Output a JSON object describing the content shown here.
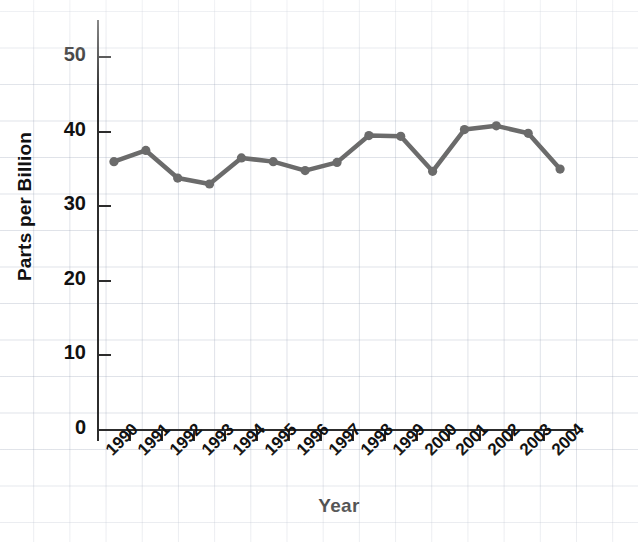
{
  "chart_data": {
    "type": "line",
    "title": "",
    "xlabel": "Year",
    "ylabel": "Parts per Billion",
    "categories": [
      "1990",
      "1991",
      "1992",
      "1993",
      "1994",
      "1995",
      "1996",
      "1997",
      "1998",
      "1999",
      "2000",
      "2001",
      "2002",
      "2003",
      "2004"
    ],
    "values": [
      36.0,
      37.5,
      33.8,
      33.0,
      36.5,
      36.0,
      34.8,
      35.9,
      39.5,
      39.4,
      34.7,
      40.3,
      40.8,
      39.8,
      35.0
    ],
    "series": [
      {
        "name": "Parts per Billion",
        "values": [
          36.0,
          37.5,
          33.8,
          33.0,
          36.5,
          36.0,
          34.8,
          35.9,
          39.5,
          39.4,
          34.7,
          40.3,
          40.8,
          39.8,
          35.0
        ]
      }
    ],
    "ylim": [
      0,
      55
    ],
    "yticks": [
      0,
      10,
      20,
      30,
      40,
      50
    ],
    "ytick_labels": [
      "0",
      "10",
      "20",
      "30",
      "40",
      "50"
    ],
    "xlim": [
      -0.5,
      14.5
    ],
    "grid": "background graph paper, no plot gridlines",
    "legend": "none",
    "line_color": "#6b6b6b",
    "marker": "circle",
    "marker_color": "#6b6b6b",
    "axis_color": "#2c2c2c",
    "background_color": "#ffffff",
    "grid_color": "#c8cfdb"
  },
  "axes": {
    "y_title": "Parts per Billion",
    "x_title": "Year"
  }
}
